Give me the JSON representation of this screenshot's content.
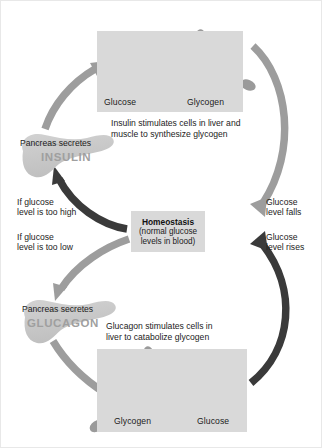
{
  "figure": {
    "colors": {
      "panel_bg": "#d9d9d9",
      "glucose_hexagon": "#595959",
      "glycogen_unit": "#9a9a9a",
      "light_arrow": "#9d9d9d",
      "dark_arrow": "#3a3a3a",
      "pancreas": "#c9c9c9",
      "text": "#1b1b1b",
      "hormone_text": "#9f9f9f",
      "background": "#ffffff"
    }
  },
  "center": {
    "title": "Homeostasis",
    "subtitle": "(normal glucose\nlevels in blood)"
  },
  "top_panel": {
    "left_label": "Glucose",
    "right_label": "Glycogen",
    "reaction_arrow": "right-arrow-icon",
    "caption": "Insulin stimulates cells in liver and\nmuscle to synthesize glycogen"
  },
  "bottom_panel": {
    "left_label": "Glycogen",
    "right_label": "Glucose",
    "reaction_arrow": "right-arrow-icon",
    "caption": "Glucagon stimulates cells in\nliver to catabolize glycogen"
  },
  "pancreas_insulin": {
    "secretes_label": "Pancreas secretes",
    "hormone": "INSULIN"
  },
  "pancreas_glucagon": {
    "secretes_label": "Pancreas secretes",
    "hormone": "GLUCAGON"
  },
  "labels": {
    "too_high": "If glucose\nlevel is too high",
    "too_low": "If glucose\nlevel is too low",
    "level_falls": "Glucose\nlevel falls",
    "level_rises": "Glucose\nlevel rises"
  }
}
